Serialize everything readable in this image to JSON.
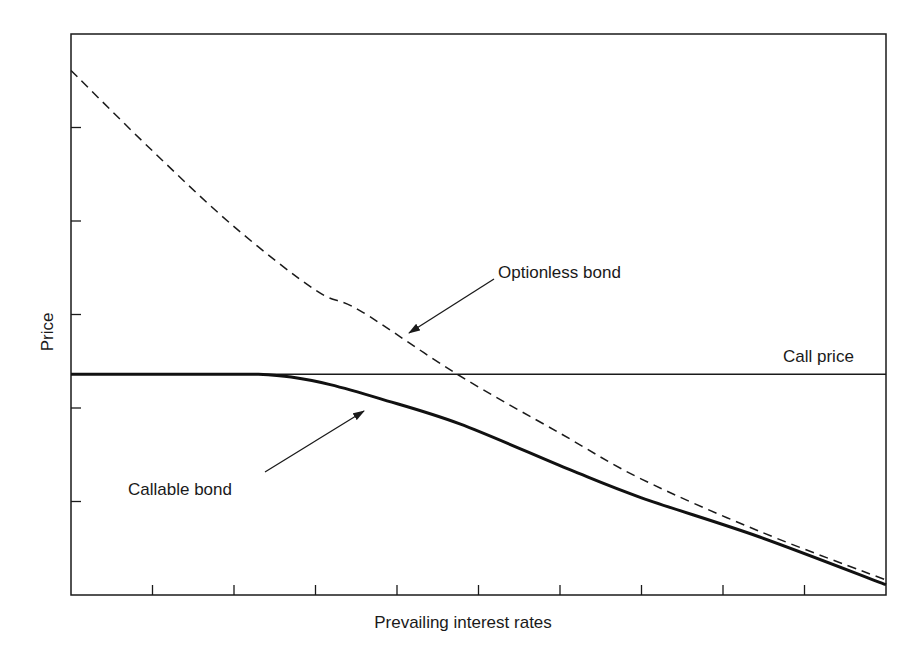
{
  "chart_data": {
    "type": "line",
    "title": "",
    "xlabel": "Prevailing interest rates",
    "ylabel": "Price",
    "xlim": [
      0,
      10
    ],
    "ylim": [
      0,
      6
    ],
    "x_ticks": [
      1,
      2,
      3,
      4,
      5,
      6,
      7,
      8,
      9
    ],
    "y_ticks": [
      1,
      2,
      3,
      4,
      5
    ],
    "x_tick_labels": [],
    "y_tick_labels": [],
    "grid": false,
    "legend": null,
    "reference_lines": [
      {
        "name": "Call price",
        "orientation": "horizontal",
        "y": 2.36,
        "style": "solid"
      }
    ],
    "series": [
      {
        "name": "Optionless bond",
        "style": "dashed",
        "points": [
          [
            0.0,
            5.61
          ],
          [
            1.0,
            4.75
          ],
          [
            2.0,
            3.94
          ],
          [
            3.0,
            3.26
          ],
          [
            3.55,
            3.04
          ],
          [
            4.74,
            2.36
          ],
          [
            6.0,
            1.73
          ],
          [
            7.0,
            1.24
          ],
          [
            8.45,
            0.68
          ],
          [
            10.0,
            0.16
          ]
        ]
      },
      {
        "name": "Callable bond",
        "style": "solid-bold",
        "points": [
          [
            0.0,
            2.36
          ],
          [
            1.0,
            2.36
          ],
          [
            2.0,
            2.36
          ],
          [
            2.3,
            2.36
          ],
          [
            2.7,
            2.33
          ],
          [
            3.18,
            2.25
          ],
          [
            3.79,
            2.1
          ],
          [
            4.77,
            1.83
          ],
          [
            6.12,
            1.34
          ],
          [
            7.0,
            1.04
          ],
          [
            8.45,
            0.62
          ],
          [
            10.0,
            0.11
          ]
        ]
      }
    ],
    "annotations": [
      {
        "text": "Optionless bond",
        "arrow_to": "Optionless bond",
        "arrow_tip": [
          4.14,
          2.8
        ],
        "text_pos": [
          5.24,
          3.39
        ]
      },
      {
        "text": "Callable bond",
        "arrow_to": "Callable bond",
        "arrow_tip": [
          3.58,
          1.97
        ],
        "text_pos": [
          0.7,
          1.07
        ]
      },
      {
        "text": "Call price",
        "arrow_to": null,
        "text_pos": [
          8.73,
          2.49
        ]
      }
    ]
  },
  "labels": {
    "x_axis": "Prevailing interest rates",
    "y_axis": "Price",
    "optionless": "Optionless bond",
    "callable": "Callable bond",
    "call_price": "Call price"
  },
  "colors": {
    "line": "#1a1a1a",
    "background": "#ffffff"
  }
}
